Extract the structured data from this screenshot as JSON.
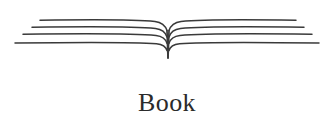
{
  "figure": {
    "caption": "Book",
    "background_color": "#ffffff",
    "ink_color": "#3a3a3a",
    "caption_color": "#2b2b2b",
    "style": "scanned line art",
    "illustration": {
      "name": "open-book",
      "spine_x": 167,
      "spine_tail_bottom_y": 58,
      "page_line_pairs": 4,
      "left_pages": [
        {
          "start_x": 40,
          "start_y": 20,
          "spine_y": 22
        },
        {
          "start_x": 32,
          "start_y": 27,
          "spine_y": 29
        },
        {
          "start_x": 23,
          "start_y": 34,
          "spine_y": 36
        },
        {
          "start_x": 15,
          "start_y": 43,
          "spine_y": 44
        }
      ],
      "right_pages": [
        {
          "end_x": 296,
          "end_y": 20,
          "spine_y": 22
        },
        {
          "end_x": 304,
          "end_y": 27,
          "spine_y": 29
        },
        {
          "end_x": 312,
          "end_y": 34,
          "spine_y": 36
        },
        {
          "end_x": 319,
          "end_y": 43,
          "spine_y": 44
        }
      ]
    }
  }
}
